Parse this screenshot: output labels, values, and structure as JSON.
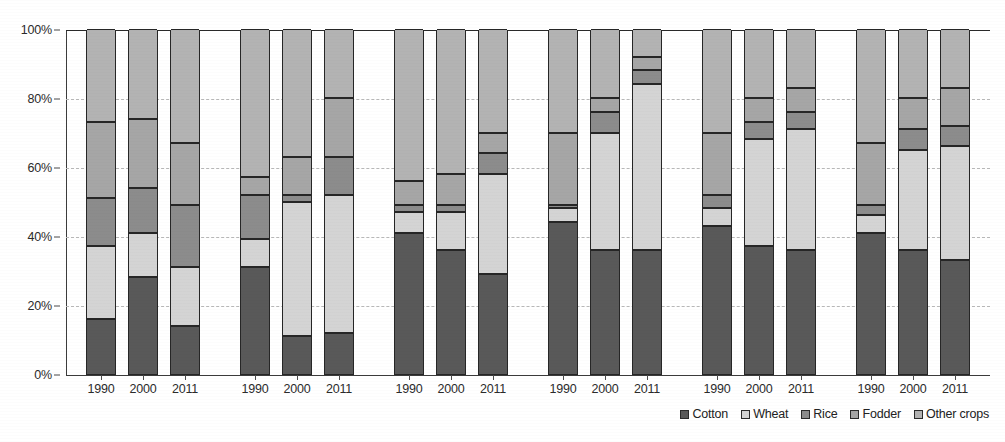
{
  "chart_data": {
    "type": "bar",
    "subtype": "stacked-percentage",
    "title": "",
    "subtitle": "",
    "xlabel": "",
    "ylabel": "",
    "ylim": [
      0,
      100
    ],
    "y_ticks": [
      0,
      20,
      40,
      60,
      80,
      100
    ],
    "y_tick_labels": [
      "0%",
      "20%",
      "40%",
      "60%",
      "80%",
      "100%"
    ],
    "grid": "horizontal-dashed",
    "legend_position": "bottom-right",
    "categories": [
      "1990",
      "2000",
      "2011"
    ],
    "series_names": [
      "Cotton",
      "Wheat",
      "Rice",
      "Fodder",
      "Other crops"
    ],
    "series_colors": [
      "#595959",
      "#d4d4d4",
      "#8c8c8c",
      "#a6a6a6",
      "#b3b3b3"
    ],
    "groups": [
      {
        "name": "Group 1",
        "bars": [
          {
            "year": "1990",
            "values": [
              16,
              21,
              14,
              22,
              27
            ]
          },
          {
            "year": "2000",
            "values": [
              28,
              13,
              13,
              20,
              26
            ]
          },
          {
            "year": "2011",
            "values": [
              14,
              17,
              18,
              18,
              33
            ]
          }
        ]
      },
      {
        "name": "Group 2",
        "bars": [
          {
            "year": "1990",
            "values": [
              31,
              8,
              13,
              5,
              43
            ]
          },
          {
            "year": "2000",
            "values": [
              11,
              39,
              2,
              11,
              37
            ]
          },
          {
            "year": "2011",
            "values": [
              12,
              40,
              11,
              17,
              20
            ]
          }
        ]
      },
      {
        "name": "Group 3",
        "bars": [
          {
            "year": "1990",
            "values": [
              41,
              6,
              2,
              7,
              44
            ]
          },
          {
            "year": "2000",
            "values": [
              36,
              11,
              2,
              9,
              42
            ]
          },
          {
            "year": "2011",
            "values": [
              29,
              29,
              6,
              6,
              30
            ]
          }
        ]
      },
      {
        "name": "Group 4",
        "bars": [
          {
            "year": "1990",
            "values": [
              44,
              4,
              1,
              21,
              30
            ]
          },
          {
            "year": "2000",
            "values": [
              36,
              34,
              6,
              4,
              20
            ]
          },
          {
            "year": "2011",
            "values": [
              36,
              48,
              4,
              4,
              8
            ]
          }
        ]
      },
      {
        "name": "Group 5",
        "bars": [
          {
            "year": "1990",
            "values": [
              43,
              5,
              4,
              18,
              30
            ]
          },
          {
            "year": "2000",
            "values": [
              37,
              31,
              5,
              7,
              20
            ]
          },
          {
            "year": "2011",
            "values": [
              36,
              35,
              5,
              7,
              17
            ]
          }
        ]
      },
      {
        "name": "Group 6",
        "bars": [
          {
            "year": "1990",
            "values": [
              41,
              5,
              3,
              18,
              33
            ]
          },
          {
            "year": "2000",
            "values": [
              36,
              29,
              6,
              9,
              20
            ]
          },
          {
            "year": "2011",
            "values": [
              33,
              33,
              6,
              11,
              17
            ]
          }
        ]
      }
    ]
  },
  "legend": {
    "items": [
      {
        "label": "Cotton",
        "color": "#595959"
      },
      {
        "label": "Wheat",
        "color": "#d4d4d4"
      },
      {
        "label": "Rice",
        "color": "#8c8c8c"
      },
      {
        "label": "Fodder",
        "color": "#a6a6a6"
      },
      {
        "label": "Other crops",
        "color": "#b3b3b3"
      }
    ]
  }
}
